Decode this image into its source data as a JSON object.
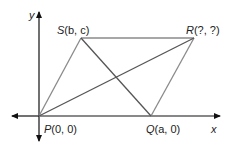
{
  "diagram": {
    "type": "coordinate-geometry-parallelogram",
    "axes": {
      "x_label": "x",
      "y_label": "y",
      "origin_px": [
        39,
        116
      ]
    },
    "points": {
      "P": {
        "letter": "P",
        "coords": "(0, 0)",
        "px": [
          39,
          116
        ]
      },
      "Q": {
        "letter": "Q",
        "coords": "(a, 0)",
        "px": [
          151,
          116
        ]
      },
      "R": {
        "letter": "R",
        "coords": "(?, ?)",
        "px": [
          194,
          38
        ]
      },
      "S": {
        "letter": "S",
        "coords": "(b, c)",
        "px": [
          81,
          38
        ]
      }
    },
    "segments": [
      "PS",
      "SR",
      "PQ",
      "QR",
      "PR",
      "SQ"
    ],
    "colors": {
      "axis": "#111111",
      "shape": "#8a8a8a",
      "diagonal": "#555555",
      "text": "#222222"
    }
  }
}
